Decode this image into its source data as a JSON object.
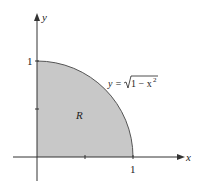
{
  "figure": {
    "axes": {
      "x_label": "x",
      "y_label": "y",
      "x_tick_label": "1",
      "y_tick_label": "1"
    },
    "curve": {
      "label_lhs": "y =",
      "label_rhs": "1 − x",
      "label_exp": "2",
      "equation": "y = √(1 − x²)"
    },
    "region": {
      "label": "R",
      "fill_color": "#c8c8c8"
    },
    "colors": {
      "axis": "#333333",
      "curve": "#555555"
    }
  }
}
